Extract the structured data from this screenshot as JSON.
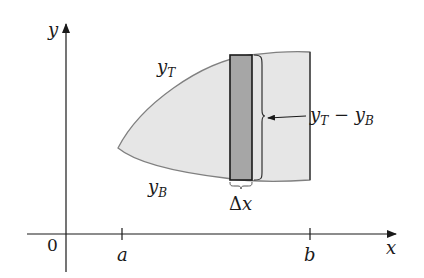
{
  "figure": {
    "type": "area-between-curves",
    "colors": {
      "region_fill": "#e6e6e6",
      "region_stroke": "#808080",
      "strip_fill": "#a6a6a6",
      "strip_stroke": "#1a1a1a",
      "axis": "#1a1a1a"
    },
    "axes": {
      "y_label": "y",
      "x_label": "x",
      "origin_label": "0"
    },
    "ticks": [
      {
        "label": "a"
      },
      {
        "label": "b"
      }
    ],
    "curves": {
      "top": {
        "label_main": "y",
        "label_sub": "T"
      },
      "bottom": {
        "label_main": "y",
        "label_sub": "B"
      }
    },
    "height_annotation": {
      "main1": "y",
      "sub1": "T",
      "op": " − ",
      "main2": "y",
      "sub2": "B"
    },
    "width_annotation": {
      "delta": "Δ",
      "var": "x"
    }
  }
}
